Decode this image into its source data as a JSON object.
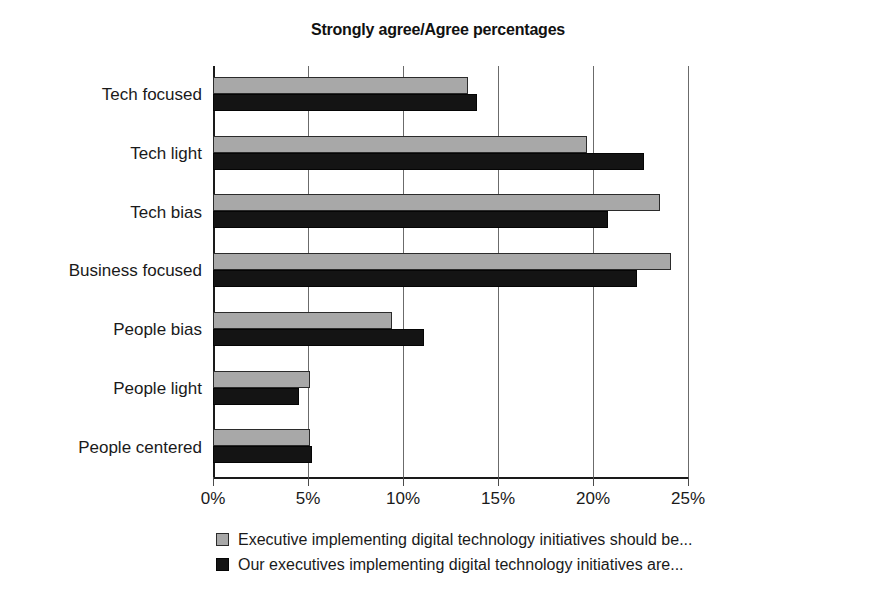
{
  "chart_data": {
    "type": "bar",
    "orientation": "horizontal",
    "title": "Strongly agree/Agree percentages",
    "xlabel": "",
    "ylabel": "",
    "xlim": [
      0,
      25
    ],
    "xticks": [
      "0%",
      "5%",
      "10%",
      "15%",
      "20%",
      "25%"
    ],
    "xtick_values": [
      0,
      5,
      10,
      15,
      20,
      25
    ],
    "grid": "vertical",
    "legend_position": "bottom",
    "categories": [
      "Tech focused",
      "Tech light",
      "Tech bias",
      "Business focused",
      "People bias",
      "People light",
      "People centered"
    ],
    "series": [
      {
        "name": "Executive implementing digital technology initiatives should be...",
        "color": "#a8a8a8",
        "values": [
          13.4,
          19.7,
          23.5,
          24.1,
          9.4,
          5.1,
          5.1
        ]
      },
      {
        "name": "Our executives implementing digital technology initiatives are...",
        "color": "#141414",
        "values": [
          13.9,
          22.7,
          20.8,
          22.3,
          11.1,
          4.5,
          5.2
        ]
      }
    ]
  },
  "legend": {
    "items": [
      {
        "swatch": "series-a",
        "label": "Executive implementing digital technology initiatives should be..."
      },
      {
        "swatch": "series-b",
        "label": "Our executives implementing digital technology initiatives are..."
      }
    ]
  }
}
